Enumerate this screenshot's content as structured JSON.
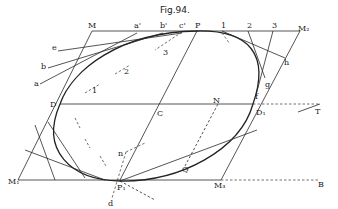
{
  "figure": {
    "title": "Fig.94.",
    "labels": {
      "M": "M",
      "a_prime": "a'",
      "b_prime": "b'",
      "c_prime": "c'",
      "P": "P",
      "one": "1",
      "two": "2",
      "three": "3",
      "M2": "M₂",
      "e": "e",
      "b": "b",
      "a": "a",
      "h": "h",
      "g": "g",
      "f": "f",
      "D": "D",
      "C": "C",
      "N": "N",
      "D1": "D₁",
      "T": "T",
      "inner1": "1",
      "inner2": "2",
      "inner3": "3",
      "n": "n",
      "Q": "Q",
      "M1": "M₁",
      "P1": "P₁",
      "M3": "M₃",
      "B": "B",
      "d": "d"
    }
  }
}
